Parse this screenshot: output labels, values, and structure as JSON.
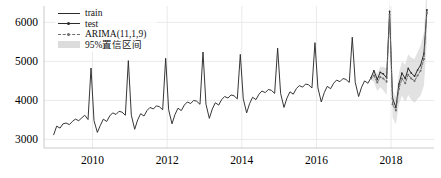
{
  "chart_data": {
    "type": "line",
    "title": "",
    "xlabel": "",
    "ylabel": "",
    "xlim": [
      2008.7,
      2019.15
    ],
    "ylim": [
      2780,
      6420
    ],
    "xticks": [
      2010,
      2012,
      2014,
      2016,
      2018
    ],
    "xtick_labels": [
      "2010",
      "2012",
      "2014",
      "2016",
      "2018"
    ],
    "yticks": [
      3000,
      4000,
      5000,
      6000
    ],
    "ytick_labels": [
      "3000",
      "4000",
      "5000",
      "6000"
    ],
    "grid": true,
    "grid_color": "#e8e8e8",
    "legend_position": "upper left",
    "colors": {
      "train": "#2b2b2b",
      "test": "#2b2b2b",
      "forecast": "#6e6e6e",
      "confidence_band": "#cfcfcf",
      "background": "#ffffff",
      "axis_text": "#000000"
    },
    "legend": [
      {
        "label": "train",
        "style": "solid-line",
        "color": "#2b2b2b"
      },
      {
        "label": "test",
        "style": "solid-line-marker",
        "color": "#2b2b2b"
      },
      {
        "label": "ARIMA(11,1,9)",
        "style": "dashed-line-marker",
        "color": "#6e6e6e"
      },
      {
        "label": "95%置信区间",
        "style": "filled-band",
        "color": "#cfcfcf"
      }
    ],
    "series": [
      {
        "name": "train",
        "x": [
          2008.96,
          2009.04,
          2009.13,
          2009.21,
          2009.29,
          2009.38,
          2009.46,
          2009.54,
          2009.63,
          2009.71,
          2009.79,
          2009.88,
          2009.96,
          2010.04,
          2010.13,
          2010.21,
          2010.29,
          2010.38,
          2010.46,
          2010.54,
          2010.63,
          2010.71,
          2010.79,
          2010.88,
          2010.96,
          2011.04,
          2011.13,
          2011.21,
          2011.29,
          2011.38,
          2011.46,
          2011.54,
          2011.63,
          2011.71,
          2011.79,
          2011.88,
          2011.96,
          2012.04,
          2012.13,
          2012.21,
          2012.29,
          2012.38,
          2012.46,
          2012.54,
          2012.63,
          2012.71,
          2012.79,
          2012.88,
          2012.96,
          2013.04,
          2013.13,
          2013.21,
          2013.29,
          2013.38,
          2013.46,
          2013.54,
          2013.63,
          2013.71,
          2013.79,
          2013.88,
          2013.96,
          2014.04,
          2014.13,
          2014.21,
          2014.29,
          2014.38,
          2014.46,
          2014.54,
          2014.63,
          2014.71,
          2014.79,
          2014.88,
          2014.96,
          2015.04,
          2015.13,
          2015.21,
          2015.29,
          2015.38,
          2015.46,
          2015.54,
          2015.63,
          2015.71,
          2015.79,
          2015.88,
          2015.96,
          2016.04,
          2016.13,
          2016.21,
          2016.29,
          2016.38,
          2016.46,
          2016.54,
          2016.63,
          2016.71,
          2016.79,
          2016.88,
          2016.96,
          2017.04,
          2017.13,
          2017.21,
          2017.29,
          2017.38,
          2017.46
        ],
        "y": [
          3120,
          3340,
          3290,
          3400,
          3420,
          3380,
          3460,
          3520,
          3480,
          3550,
          3620,
          3510,
          4830,
          3480,
          3180,
          3360,
          3520,
          3460,
          3600,
          3680,
          3640,
          3720,
          3700,
          3620,
          5020,
          3620,
          3260,
          3500,
          3660,
          3600,
          3740,
          3820,
          3780,
          3860,
          3840,
          3760,
          5080,
          3760,
          3400,
          3640,
          3800,
          3740,
          3880,
          3960,
          3920,
          4000,
          3980,
          3900,
          5240,
          3900,
          3540,
          3780,
          3940,
          3880,
          4020,
          4100,
          4060,
          4140,
          4120,
          4040,
          5180,
          4040,
          3680,
          3920,
          4080,
          4020,
          4160,
          4240,
          4200,
          4280,
          4260,
          4180,
          5340,
          4180,
          3820,
          4060,
          4220,
          4160,
          4300,
          4380,
          4340,
          4420,
          4400,
          4320,
          5480,
          4320,
          3960,
          4200,
          4360,
          4300,
          4440,
          4520,
          4480,
          4560,
          4540,
          4460,
          5620,
          4460,
          4100,
          4340,
          4500,
          4440,
          4580
        ]
      },
      {
        "name": "test",
        "x": [
          2017.46,
          2017.54,
          2017.63,
          2017.71,
          2017.79,
          2017.88,
          2017.96,
          2018.04,
          2018.13,
          2018.21,
          2018.29,
          2018.38,
          2018.46,
          2018.54,
          2018.63,
          2018.71,
          2018.79,
          2018.88,
          2018.96
        ],
        "y": [
          4580,
          4760,
          4540,
          4720,
          4680,
          4580,
          6280,
          4050,
          3820,
          4420,
          4700,
          4560,
          4820,
          4700,
          4620,
          4780,
          4900,
          5200,
          6320
        ]
      },
      {
        "name": "ARIMA(11,1,9)",
        "x": [
          2017.46,
          2017.54,
          2017.63,
          2017.71,
          2017.79,
          2017.88,
          2017.96,
          2018.04,
          2018.13,
          2018.21,
          2018.29,
          2018.38,
          2018.46,
          2018.54,
          2018.63,
          2018.71,
          2018.79,
          2018.88,
          2018.96
        ],
        "y": [
          4560,
          4640,
          4460,
          4600,
          4560,
          4480,
          6200,
          3900,
          3740,
          4300,
          4560,
          4440,
          4660,
          4560,
          4500,
          4640,
          4760,
          5060,
          6250
        ]
      }
    ],
    "confidence_band": {
      "name": "95%置信区间",
      "x": [
        2017.46,
        2017.54,
        2017.63,
        2017.71,
        2017.79,
        2017.88,
        2017.96,
        2018.04,
        2018.13,
        2018.21,
        2018.29,
        2018.38,
        2018.46,
        2018.54,
        2018.63,
        2018.71,
        2018.79,
        2018.88,
        2018.96
      ],
      "lower": [
        4520,
        4480,
        4240,
        4340,
        4260,
        4140,
        5820,
        3560,
        3380,
        3900,
        4120,
        3960,
        4140,
        4020,
        3940,
        4040,
        4120,
        4380,
        5520
      ],
      "upper": [
        4600,
        4800,
        4680,
        4860,
        4860,
        4820,
        6580,
        4240,
        4100,
        4700,
        5000,
        4920,
        5180,
        5100,
        5060,
        5240,
        5400,
        5740,
        6980
      ]
    }
  }
}
